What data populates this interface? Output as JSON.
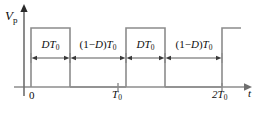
{
  "figure": {
    "type": "pulse-waveform-timing-diagram",
    "background_color": "#ffffff",
    "line_color": "#8c8c8c",
    "text_color": "#0d0d0d"
  },
  "axes": {
    "y_axis": {
      "label_V": "V",
      "label_sub": "p",
      "x_px": 24,
      "top_px": 8,
      "baseline_px": 87,
      "arrow": "up"
    },
    "x_axis": {
      "label": "t",
      "y_px": 87,
      "start_px": 14,
      "end_px": 246,
      "arrow": "right"
    },
    "ticks": [
      {
        "label": "0",
        "sub": "",
        "x_px": 31
      },
      {
        "label": "T",
        "sub": "0",
        "x_px": 118
      },
      {
        "label": "2T",
        "sub": "0",
        "x_px": 222
      }
    ]
  },
  "waveform": {
    "high_level_px": 28,
    "low_level_px": 87,
    "pulses": [
      {
        "rise_px": 31,
        "fall_px": 70
      },
      {
        "rise_px": 126,
        "fall_px": 165
      },
      {
        "rise_px": 222,
        "fall_px": 241
      }
    ]
  },
  "dimensions": [
    {
      "id": "dim-1",
      "parts": [
        {
          "text": "D",
          "style": "ital"
        },
        {
          "text": "T",
          "style": "ital"
        },
        {
          "text": "0",
          "style": "sub"
        }
      ],
      "plain": "DT0",
      "from_px": 31,
      "to_px": 70,
      "y_px": 58
    },
    {
      "id": "dim-2",
      "parts": [
        {
          "text": "(1−",
          "style": "up"
        },
        {
          "text": "D",
          "style": "ital"
        },
        {
          "text": ")",
          "style": "up"
        },
        {
          "text": "T",
          "style": "ital"
        },
        {
          "text": "0",
          "style": "sub"
        }
      ],
      "plain": "(1-D)T0",
      "from_px": 70,
      "to_px": 126,
      "y_px": 58
    },
    {
      "id": "dim-3",
      "parts": [
        {
          "text": "D",
          "style": "ital"
        },
        {
          "text": "T",
          "style": "ital"
        },
        {
          "text": "0",
          "style": "sub"
        }
      ],
      "plain": "DT0",
      "from_px": 126,
      "to_px": 165,
      "y_px": 58
    },
    {
      "id": "dim-4",
      "parts": [
        {
          "text": "(1−",
          "style": "up"
        },
        {
          "text": "D",
          "style": "ital"
        },
        {
          "text": ")",
          "style": "up"
        },
        {
          "text": "T",
          "style": "ital"
        },
        {
          "text": "0",
          "style": "sub"
        }
      ],
      "plain": "(1-D)T0",
      "from_px": 165,
      "to_px": 222,
      "y_px": 58
    }
  ],
  "labels": {
    "vp_v": "V",
    "vp_sub": "p",
    "t": "t",
    "tick_0": "0",
    "tick_T": "T",
    "tick_T_sub": "0",
    "tick_2T": "2T",
    "tick_2T_sub": "0",
    "D": "D",
    "T": "T",
    "T_sub": "0",
    "one_minus_open": "(1−",
    "close_paren": ")"
  }
}
